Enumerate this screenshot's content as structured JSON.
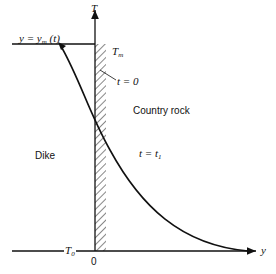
{
  "diagram": {
    "axes": {
      "vertical_label": "T",
      "horizontal_label": "y",
      "origin_label": "0"
    },
    "labels": {
      "melt_temp": "T",
      "melt_temp_sub": "m",
      "ambient_temp": "T",
      "ambient_temp_sub": "0",
      "interface": "y = y",
      "interface_sub": "m",
      "interface_tail": "(t)",
      "t_zero": "t = 0",
      "t_one": "t = t",
      "t_one_sub": "1",
      "dike": "Dike",
      "country_rock": "Country rock"
    },
    "colors": {
      "line": "#111111",
      "background": "#ffffff"
    }
  }
}
